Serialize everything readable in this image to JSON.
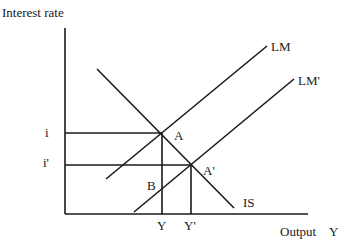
{
  "axes": {
    "y_label": "Interest rate",
    "x_label": "Output",
    "x_symbol": "Y"
  },
  "curves": {
    "is_label": "IS",
    "lm_label": "LM",
    "lm_prime_label": "LM'"
  },
  "points": {
    "a": "A",
    "a_prime": "A'",
    "b": "B"
  },
  "ticks": {
    "i": "i",
    "i_prime": "i'",
    "y": "Y",
    "y_prime": "Y'"
  },
  "colors": {
    "line": "#1a1a1a",
    "background": "#ffffff"
  }
}
